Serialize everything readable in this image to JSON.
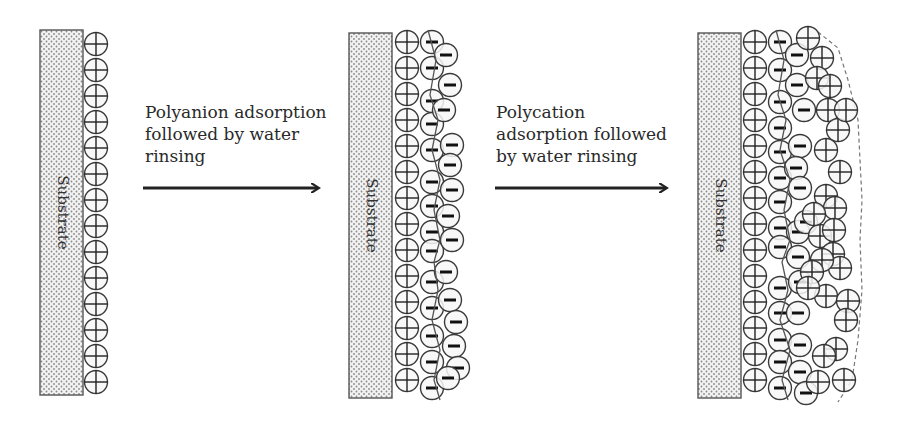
{
  "colors": {
    "ink": "#3a3a3a",
    "substrate_fill": "#f2f2f2",
    "substrate_dot": "#8a8a8a",
    "circle_fill": "#f7f7f7",
    "polymer_line": "#555555"
  },
  "steps": [
    {
      "label": "Polyanion adsorption\nfollowed by water\nrinsing",
      "arrow": {
        "x1": 143,
        "x2": 318,
        "y": 188
      }
    },
    {
      "label": "Polycation\nadsorption followed\nby water rinsing",
      "arrow": {
        "x1": 495,
        "x2": 666,
        "y": 188
      }
    }
  ],
  "panels": [
    {
      "substrate": {
        "label": "Substrate",
        "x": 40,
        "y": 30,
        "w": 43,
        "h": 365
      },
      "layers": [
        {
          "charge": "+",
          "x": 96,
          "ys": [
            44,
            70,
            96,
            122,
            148,
            174,
            200,
            226,
            252,
            278,
            304,
            330,
            356,
            382
          ]
        }
      ]
    },
    {
      "substrate": {
        "label": "Substrate",
        "x": 349,
        "y": 33,
        "w": 43,
        "h": 365
      },
      "layers": [
        {
          "charge": "+",
          "x": 407,
          "ys": [
            42,
            68,
            94,
            120,
            146,
            172,
            198,
            224,
            250,
            276,
            302,
            328,
            354,
            380
          ]
        },
        {
          "charge": "-",
          "x": 432,
          "ys": [
            42,
            68,
            101,
            124,
            150,
            182,
            206,
            232,
            251,
            282,
            308,
            336,
            362,
            388
          ]
        },
        {
          "charge": "-",
          "x": 450,
          "pts": [
            [
              446,
              55
            ],
            [
              450,
              85
            ],
            [
              444,
              110
            ],
            [
              452,
              145
            ],
            [
              450,
              165
            ],
            [
              452,
              190
            ],
            [
              448,
              216
            ],
            [
              452,
              240
            ],
            [
              446,
              272
            ],
            [
              450,
              300
            ],
            [
              456,
              322
            ],
            [
              454,
              346
            ],
            [
              458,
              368
            ],
            [
              448,
              378
            ]
          ]
        }
      ],
      "polymer": [
        [
          428,
          30
        ],
        [
          436,
          60
        ],
        [
          430,
          95
        ],
        [
          438,
          120
        ],
        [
          432,
          150
        ],
        [
          440,
          180
        ],
        [
          434,
          210
        ],
        [
          440,
          240
        ],
        [
          434,
          262
        ],
        [
          438,
          290
        ],
        [
          432,
          320
        ],
        [
          440,
          350
        ],
        [
          434,
          380
        ],
        [
          440,
          400
        ]
      ]
    },
    {
      "substrate": {
        "label": "Substrate",
        "x": 698,
        "y": 33,
        "w": 43,
        "h": 365
      },
      "layers": [
        {
          "charge": "+",
          "x": 755,
          "ys": [
            42,
            68,
            94,
            120,
            146,
            172,
            198,
            224,
            250,
            276,
            302,
            328,
            354,
            380
          ]
        },
        {
          "charge": "-",
          "x": 780,
          "ys": [
            42,
            70,
            102,
            128,
            152,
            178,
            202,
            228,
            247,
            288,
            313,
            340,
            362,
            388
          ]
        },
        {
          "charge": "-",
          "pts": [
            [
              797,
              55
            ],
            [
              797,
              85
            ],
            [
              804,
              110
            ],
            [
              800,
              146
            ],
            [
              796,
              168
            ],
            [
              800,
              188
            ],
            [
              798,
              232
            ],
            [
              798,
              257
            ],
            [
              798,
              313
            ],
            [
              800,
              345
            ],
            [
              800,
              372
            ],
            [
              806,
              393
            ],
            [
              806,
              222
            ],
            [
              800,
              282
            ]
          ]
        },
        {
          "charge": "+",
          "pts": [
            [
              808,
              38
            ],
            [
              822,
              58
            ],
            [
              817,
              78
            ],
            [
              830,
              86
            ],
            [
              828,
              110
            ],
            [
              838,
              130
            ],
            [
              826,
              150
            ],
            [
              840,
              172
            ],
            [
              826,
              196
            ],
            [
              835,
              208
            ],
            [
              820,
              236
            ],
            [
              833,
              254
            ],
            [
              840,
              268
            ],
            [
              826,
              296
            ],
            [
              848,
              301
            ],
            [
              846,
              320
            ],
            [
              836,
              349
            ],
            [
              824,
              356
            ],
            [
              844,
              380
            ],
            [
              818,
              382
            ],
            [
              822,
              260
            ],
            [
              812,
              272
            ],
            [
              834,
              230
            ],
            [
              846,
              110
            ],
            [
              814,
              214
            ],
            [
              808,
              288
            ]
          ]
        }
      ],
      "polymer": [
        [
          776,
          30
        ],
        [
          784,
          60
        ],
        [
          778,
          95
        ],
        [
          786,
          120
        ],
        [
          780,
          150
        ],
        [
          790,
          180
        ],
        [
          784,
          210
        ],
        [
          790,
          240
        ],
        [
          782,
          262
        ],
        [
          788,
          290
        ],
        [
          780,
          320
        ],
        [
          790,
          350
        ],
        [
          782,
          380
        ],
        [
          788,
          400
        ]
      ],
      "dashed_edge": [
        [
          818,
          32
        ],
        [
          838,
          48
        ],
        [
          848,
          80
        ],
        [
          858,
          120
        ],
        [
          860,
          160
        ],
        [
          862,
          200
        ],
        [
          860,
          240
        ],
        [
          862,
          290
        ],
        [
          858,
          340
        ],
        [
          852,
          380
        ],
        [
          838,
          402
        ]
      ]
    }
  ]
}
